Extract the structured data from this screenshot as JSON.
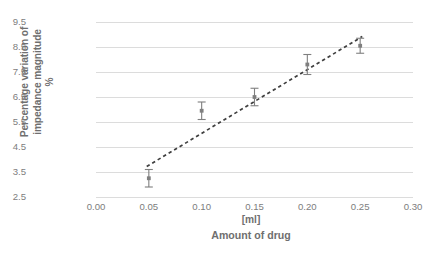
{
  "chart_data": {
    "type": "scatter",
    "title": "",
    "xlabel": "Amount of drug",
    "xunit": "[ml]",
    "ylabel": "Percentage variation of impedance magnitude",
    "yunit": "%",
    "ylabel_lines": [
      "Percentage variation of",
      "impedance magnitude",
      "%"
    ],
    "xlim": [
      0.0,
      0.3
    ],
    "ylim": [
      2.5,
      9.5
    ],
    "xticks": [
      "0.00",
      "0.05",
      "0.10",
      "0.15",
      "0.20",
      "0.25",
      "0.30"
    ],
    "xtick_values": [
      0.0,
      0.05,
      0.1,
      0.15,
      0.2,
      0.25,
      0.3
    ],
    "yticks": [
      "2.5",
      "3.5",
      "4.5",
      "5.5",
      "6.5",
      "7.5",
      "8.5",
      "9.5"
    ],
    "ytick_values": [
      2.5,
      3.5,
      4.5,
      5.5,
      6.5,
      7.5,
      8.5,
      9.5
    ],
    "grid": "horizontal",
    "legend": "none",
    "x": [
      0.05,
      0.1,
      0.15,
      0.2,
      0.25
    ],
    "values": [
      3.25,
      5.95,
      6.5,
      7.8,
      8.55
    ],
    "yerr": [
      0.35,
      0.35,
      0.35,
      0.4,
      0.3
    ],
    "marker_color": "#7f7f7f",
    "errorbar_color": "#7f7f7f",
    "gridline_color": "#dcdcdc",
    "text_color": "#7d7d7d",
    "background_color": "#ffffff",
    "trendline": {
      "style": "dashed",
      "color": "#3f3f3f",
      "x_start": 0.048,
      "y_start": 3.72,
      "x_end": 0.252,
      "y_end": 8.92
    }
  }
}
